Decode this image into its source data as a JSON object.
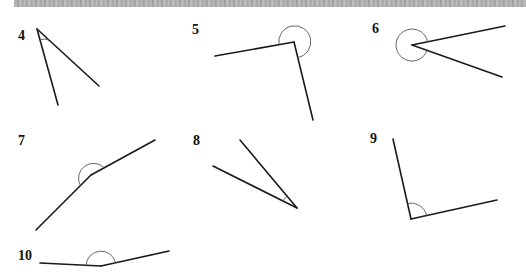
{
  "header": {
    "banner": "scanned-page-top-strip"
  },
  "exercise": {
    "instruction": "",
    "items": [
      {
        "number": "4",
        "type": "acute",
        "vertex": [
          37,
          29
        ],
        "ray1": [
          58,
          105
        ],
        "ray2": [
          99,
          86
        ]
      },
      {
        "number": "5",
        "type": "reflex",
        "vertex": [
          294,
          42
        ],
        "ray1": [
          215,
          56
        ],
        "ray2": [
          313,
          120
        ]
      },
      {
        "number": "6",
        "type": "reflex",
        "vertex": [
          412,
          45
        ],
        "ray1": [
          505,
          26
        ],
        "ray2": [
          502,
          77
        ]
      },
      {
        "number": "7",
        "type": "obtuse",
        "vertex": [
          91,
          175
        ],
        "ray1": [
          36,
          230
        ],
        "ray2": [
          155,
          140
        ]
      },
      {
        "number": "8",
        "type": "acute",
        "vertex": [
          297,
          208
        ],
        "ray1": [
          213,
          166
        ],
        "ray2": [
          240,
          140
        ]
      },
      {
        "number": "9",
        "type": "obtuse",
        "vertex": [
          411,
          219
        ],
        "ray1": [
          393,
          139
        ],
        "ray2": [
          497,
          200
        ]
      },
      {
        "number": "10",
        "type": "obtuse",
        "vertex": [
          101,
          266
        ],
        "ray1": [
          40,
          263
        ],
        "ray2": [
          169,
          251
        ]
      }
    ]
  },
  "colors": {
    "line": "#1a1a1a",
    "arc": "#555555",
    "label": "#111111",
    "banner": "#a9a9a9"
  }
}
